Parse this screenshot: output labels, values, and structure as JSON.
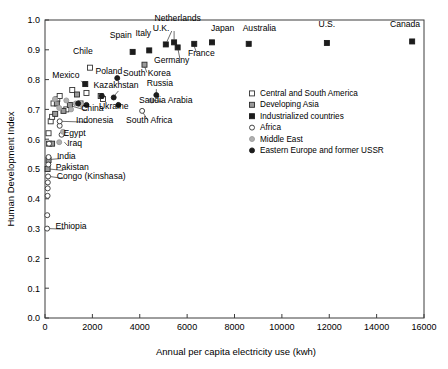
{
  "chart_data": {
    "type": "scatter",
    "title": "",
    "xlabel": "Annual per capita electricity use (kwh)",
    "ylabel": "Human Development Index",
    "xlim": [
      0,
      16000
    ],
    "ylim": [
      0.0,
      1.0
    ],
    "xticks": [
      0,
      2000,
      4000,
      6000,
      8000,
      10000,
      12000,
      14000,
      16000
    ],
    "xtick_labels": [
      "0",
      "2000",
      "4000",
      "6000",
      "8000",
      "10000",
      "12000",
      "14000",
      "16000"
    ],
    "yticks": [
      0.0,
      0.1,
      0.2,
      0.3,
      0.4,
      0.5,
      0.6,
      0.7,
      0.8,
      0.9,
      1.0
    ],
    "ytick_labels": [
      "0.0",
      "0.1",
      "0.2",
      "0.3",
      "0.4",
      "0.5",
      "0.6",
      "0.7",
      "0.8",
      "0.9",
      "1.0"
    ],
    "grid": false,
    "legend_position": "middle-right",
    "series": [
      {
        "name": "Central and South America",
        "key": "central_south_america",
        "marker": "open-square",
        "fill": "#ffffff",
        "stroke": "#333333",
        "points": [
          {
            "x": 150,
            "y": 0.62
          },
          {
            "x": 170,
            "y": 0.585
          },
          {
            "x": 240,
            "y": 0.66
          },
          {
            "x": 300,
            "y": 0.675
          },
          {
            "x": 360,
            "y": 0.72
          },
          {
            "x": 520,
            "y": 0.735
          },
          {
            "x": 620,
            "y": 0.745
          },
          {
            "x": 900,
            "y": 0.7
          },
          {
            "x": 1150,
            "y": 0.765
          },
          {
            "x": 1500,
            "y": 0.72
          },
          {
            "x": 1750,
            "y": 0.755
          },
          {
            "x": 1900,
            "y": 0.84
          },
          {
            "x": 2450,
            "y": 0.735
          }
        ]
      },
      {
        "name": "Developing Asia",
        "key": "developing_asia",
        "marker": "gray-square",
        "fill": "#9a9a9a",
        "stroke": "#2b2b2b",
        "points": [
          {
            "x": 110,
            "y": 0.5
          },
          {
            "x": 150,
            "y": 0.53
          },
          {
            "x": 300,
            "y": 0.585
          },
          {
            "x": 430,
            "y": 0.685
          },
          {
            "x": 500,
            "y": 0.72
          },
          {
            "x": 780,
            "y": 0.695
          },
          {
            "x": 1050,
            "y": 0.715
          },
          {
            "x": 1350,
            "y": 0.75
          },
          {
            "x": 2350,
            "y": 0.745
          },
          {
            "x": 4200,
            "y": 0.85
          }
        ]
      },
      {
        "name": "Industrialized countries",
        "key": "industrialized",
        "marker": "filled-square",
        "fill": "#1c1c1c",
        "stroke": "#1c1c1c",
        "points": [
          {
            "x": 1700,
            "y": 0.785
          },
          {
            "x": 3700,
            "y": 0.893
          },
          {
            "x": 4400,
            "y": 0.898
          },
          {
            "x": 5100,
            "y": 0.918
          },
          {
            "x": 5450,
            "y": 0.925
          },
          {
            "x": 5600,
            "y": 0.908
          },
          {
            "x": 6300,
            "y": 0.92
          },
          {
            "x": 7050,
            "y": 0.925
          },
          {
            "x": 8600,
            "y": 0.92
          },
          {
            "x": 11900,
            "y": 0.923
          },
          {
            "x": 15500,
            "y": 0.928
          }
        ]
      },
      {
        "name": "Africa",
        "key": "africa",
        "marker": "open-circle",
        "fill": "#ffffff",
        "stroke": "#333333",
        "points": [
          {
            "x": 90,
            "y": 0.3
          },
          {
            "x": 95,
            "y": 0.345
          },
          {
            "x": 110,
            "y": 0.41
          },
          {
            "x": 115,
            "y": 0.435
          },
          {
            "x": 120,
            "y": 0.455
          },
          {
            "x": 130,
            "y": 0.475
          },
          {
            "x": 140,
            "y": 0.515
          },
          {
            "x": 150,
            "y": 0.54
          },
          {
            "x": 170,
            "y": 0.585
          },
          {
            "x": 620,
            "y": 0.645
          },
          {
            "x": 620,
            "y": 0.66
          },
          {
            "x": 700,
            "y": 0.615
          },
          {
            "x": 4100,
            "y": 0.695
          }
        ]
      },
      {
        "name": "Middle East",
        "key": "middle_east",
        "marker": "gray-circle",
        "fill": "#b0b0b0",
        "stroke": "#9a9a9a",
        "points": [
          {
            "x": 600,
            "y": 0.59
          },
          {
            "x": 760,
            "y": 0.625
          },
          {
            "x": 420,
            "y": 0.735
          },
          {
            "x": 600,
            "y": 0.705
          },
          {
            "x": 900,
            "y": 0.73
          },
          {
            "x": 1100,
            "y": 0.7
          },
          {
            "x": 1300,
            "y": 0.72
          },
          {
            "x": 1550,
            "y": 0.715
          },
          {
            "x": 4500,
            "y": 0.73
          }
        ]
      },
      {
        "name": "Eastern Europe and former USSR",
        "key": "eastern_europe_ussr",
        "marker": "filled-circle",
        "fill": "#1c1c1c",
        "stroke": "#1c1c1c",
        "points": [
          {
            "x": 1400,
            "y": 0.72
          },
          {
            "x": 1750,
            "y": 0.715
          },
          {
            "x": 2400,
            "y": 0.745
          },
          {
            "x": 2900,
            "y": 0.74
          },
          {
            "x": 3050,
            "y": 0.805
          },
          {
            "x": 3100,
            "y": 0.715
          },
          {
            "x": 4700,
            "y": 0.748
          }
        ]
      }
    ],
    "annotations": [
      {
        "text": "Canada",
        "x": 15500,
        "y": 0.928,
        "tx": 15200,
        "ty": 0.975,
        "anchor": "middle"
      },
      {
        "text": "U.S.",
        "x": 11900,
        "y": 0.923,
        "tx": 11900,
        "ty": 0.975,
        "anchor": "middle"
      },
      {
        "text": "Australia",
        "x": 8600,
        "y": 0.92,
        "tx": 9050,
        "ty": 0.962,
        "anchor": "middle"
      },
      {
        "text": "Japan",
        "x": 7050,
        "y": 0.925,
        "tx": 7500,
        "ty": 0.962,
        "anchor": "middle"
      },
      {
        "text": "Netherlands",
        "x": 5450,
        "y": 0.925,
        "tx": 5600,
        "ty": 0.995,
        "anchor": "middle"
      },
      {
        "text": "U.K.",
        "x": 5100,
        "y": 0.918,
        "tx": 4900,
        "ty": 0.962,
        "anchor": "middle"
      },
      {
        "text": "Germany",
        "x": 5600,
        "y": 0.908,
        "tx": 5350,
        "ty": 0.855,
        "anchor": "middle"
      },
      {
        "text": "France",
        "x": 6300,
        "y": 0.92,
        "tx": 6600,
        "ty": 0.878,
        "anchor": "middle"
      },
      {
        "text": "Italy",
        "x": 4400,
        "y": 0.898,
        "tx": 4150,
        "ty": 0.945,
        "anchor": "middle"
      },
      {
        "text": "Spain",
        "x": 3700,
        "y": 0.893,
        "tx": 3200,
        "ty": 0.938,
        "anchor": "middle"
      },
      {
        "text": "Chile",
        "x": 1900,
        "y": 0.84,
        "tx": 1600,
        "ty": 0.885,
        "anchor": "middle"
      },
      {
        "text": "South Korea",
        "x": 4200,
        "y": 0.85,
        "tx": 4300,
        "ty": 0.812,
        "anchor": "middle"
      },
      {
        "text": "Poland",
        "x": 3050,
        "y": 0.805,
        "tx": 2700,
        "ty": 0.818,
        "anchor": "middle"
      },
      {
        "text": "Mexico",
        "x": 1700,
        "y": 0.785,
        "tx": 880,
        "ty": 0.805,
        "anchor": "middle"
      },
      {
        "text": "Kazakhstan",
        "x": 2900,
        "y": 0.74,
        "tx": 3000,
        "ty": 0.772,
        "anchor": "middle"
      },
      {
        "text": "Russia",
        "x": 4700,
        "y": 0.748,
        "tx": 4850,
        "ty": 0.778,
        "anchor": "middle"
      },
      {
        "text": "Saudia Arabia",
        "x": 4500,
        "y": 0.73,
        "tx": 5100,
        "ty": 0.722,
        "anchor": "middle"
      },
      {
        "text": "Ukraine",
        "x": 3100,
        "y": 0.715,
        "tx": 2900,
        "ty": 0.702,
        "anchor": "middle"
      },
      {
        "text": "China",
        "x": 1050,
        "y": 0.715,
        "tx": 2000,
        "ty": 0.695,
        "anchor": "middle"
      },
      {
        "text": "Indonesia",
        "x": 620,
        "y": 0.66,
        "tx": 2100,
        "ty": 0.655,
        "anchor": "middle"
      },
      {
        "text": "South Africa",
        "x": 4100,
        "y": 0.695,
        "tx": 4400,
        "ty": 0.655,
        "anchor": "middle"
      },
      {
        "text": "Egypt",
        "x": 620,
        "y": 0.615,
        "tx": 1250,
        "ty": 0.612,
        "anchor": "middle"
      },
      {
        "text": "Iraq",
        "x": 760,
        "y": 0.59,
        "tx": 1250,
        "ty": 0.578,
        "anchor": "middle"
      },
      {
        "text": "India",
        "x": 150,
        "y": 0.53,
        "tx": 900,
        "ty": 0.535,
        "anchor": "middle"
      },
      {
        "text": "Pakistan",
        "x": 110,
        "y": 0.5,
        "tx": 1150,
        "ty": 0.495,
        "anchor": "middle"
      },
      {
        "text": "Congo (Kinshasa)",
        "x": 130,
        "y": 0.475,
        "tx": 1950,
        "ty": 0.468,
        "anchor": "middle"
      },
      {
        "text": "Ethiopia",
        "x": 90,
        "y": 0.3,
        "tx": 1100,
        "ty": 0.298,
        "anchor": "middle"
      }
    ],
    "leader_lines": [
      {
        "x1": 5450,
        "y1": 0.963,
        "x2": 5450,
        "y2": 0.935
      },
      {
        "x1": 5350,
        "y1": 0.963,
        "x2": 5150,
        "y2": 0.928
      },
      {
        "x1": 5700,
        "y1": 0.868,
        "x2": 5620,
        "y2": 0.9
      },
      {
        "x1": 6400,
        "y1": 0.89,
        "x2": 6300,
        "y2": 0.912
      },
      {
        "x1": 4300,
        "y1": 0.824,
        "x2": 4210,
        "y2": 0.843
      },
      {
        "x1": 1530,
        "y1": 0.796,
        "x2": 1660,
        "y2": 0.783
      },
      {
        "x1": 3100,
        "y1": 0.762,
        "x2": 2930,
        "y2": 0.746
      },
      {
        "x1": 4700,
        "y1": 0.768,
        "x2": 4700,
        "y2": 0.755
      },
      {
        "x1": 4950,
        "y1": 0.726,
        "x2": 4560,
        "y2": 0.731
      },
      {
        "x1": 3080,
        "y1": 0.708,
        "x2": 3100,
        "y2": 0.718
      },
      {
        "x1": 1780,
        "y1": 0.696,
        "x2": 1090,
        "y2": 0.712
      },
      {
        "x1": 1820,
        "y1": 0.657,
        "x2": 680,
        "y2": 0.66
      },
      {
        "x1": 4350,
        "y1": 0.663,
        "x2": 4130,
        "y2": 0.69
      },
      {
        "x1": 960,
        "y1": 0.612,
        "x2": 700,
        "y2": 0.615
      },
      {
        "x1": 960,
        "y1": 0.578,
        "x2": 820,
        "y2": 0.59
      },
      {
        "x1": 660,
        "y1": 0.535,
        "x2": 210,
        "y2": 0.532
      },
      {
        "x1": 770,
        "y1": 0.495,
        "x2": 185,
        "y2": 0.5
      },
      {
        "x1": 780,
        "y1": 0.468,
        "x2": 195,
        "y2": 0.475
      },
      {
        "x1": 820,
        "y1": 0.298,
        "x2": 165,
        "y2": 0.3
      }
    ]
  },
  "legend": {
    "items": [
      {
        "label": "Central and South America",
        "marker": "open-square"
      },
      {
        "label": "Developing Asia",
        "marker": "gray-square"
      },
      {
        "label": "Industrialized countries",
        "marker": "filled-square"
      },
      {
        "label": "Africa",
        "marker": "open-circle"
      },
      {
        "label": "Middle East",
        "marker": "gray-circle"
      },
      {
        "label": "Eastern Europe and former USSR",
        "marker": "filled-circle"
      }
    ]
  },
  "colors": {
    "axis": "#3c3c3c",
    "text": "#000000",
    "open_fill": "#ffffff",
    "gray_fill": "#9a9a9a",
    "gray_circle_fill": "#b0b0b0",
    "solid_fill": "#1c1c1c",
    "background": "#ffffff"
  }
}
